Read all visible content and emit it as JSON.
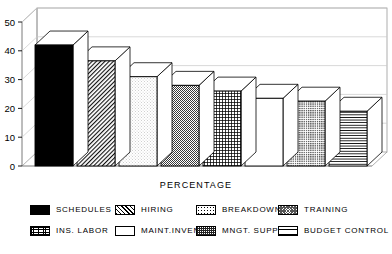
{
  "chart_data": {
    "type": "bar",
    "title": "",
    "subtitle": "",
    "xlabel": "PERCENTAGE",
    "ylabel": "",
    "ylim": [
      0,
      50
    ],
    "yticks": [
      0,
      10,
      20,
      30,
      40,
      50
    ],
    "grid": true,
    "grid_axis": "y",
    "three_d": true,
    "legend_position": "bottom",
    "categories": [
      "SCHEDULES",
      "HIRING",
      "BREAKDOWNS",
      "TRAINING",
      "INS. LABOR",
      "MAINT.INVENT",
      "MNGT. SUPPO",
      "BUDGET CONTROL"
    ],
    "values": [
      42,
      36.5,
      31,
      28,
      26,
      23.5,
      22.5,
      19
    ],
    "patterns": [
      "solid-black",
      "diagonal-hatch",
      "light-stipple",
      "dense-checker",
      "fine-grid",
      "white-empty",
      "dark-speckle",
      "horizontal-lines"
    ]
  },
  "axis": {
    "y_tick_labels": [
      "50",
      "40",
      "30",
      "20",
      "10",
      "0"
    ],
    "x_title": "PERCENTAGE"
  },
  "legend": {
    "rows": [
      [
        {
          "label": "SCHEDULES",
          "pattern": "p-solid"
        },
        {
          "label": "HIRING",
          "pattern": "p-diag"
        },
        {
          "label": "BREAKDOWNS",
          "pattern": "p-stipple"
        },
        {
          "label": "TRAINING",
          "pattern": "p-checker"
        }
      ],
      [
        {
          "label": "INS. LABOR",
          "pattern": "p-grid"
        },
        {
          "label": "MAINT.INVENT",
          "pattern": "p-white"
        },
        {
          "label": "MNGT. SUPPO",
          "pattern": "p-speckle"
        },
        {
          "label": "BUDGET CONTROL",
          "pattern": "p-hlines"
        }
      ]
    ],
    "items": [
      {
        "label": "SCHEDULES",
        "pattern": "p-solid"
      },
      {
        "label": "HIRING",
        "pattern": "p-diag"
      },
      {
        "label": "BREAKDOWNS",
        "pattern": "p-stipple"
      },
      {
        "label": "TRAINING",
        "pattern": "p-checker"
      },
      {
        "label": "INS. LABOR",
        "pattern": "p-grid"
      },
      {
        "label": "MAINT.INVENT",
        "pattern": "p-white"
      },
      {
        "label": "MNGT. SUPPO",
        "pattern": "p-speckle"
      },
      {
        "label": "BUDGET CONTROL",
        "pattern": "p-hlines"
      }
    ]
  },
  "colors": {
    "background": "#ffffff",
    "ink": "#000000",
    "grid": "#c8c8c8",
    "frame": "#9a9a9a"
  }
}
